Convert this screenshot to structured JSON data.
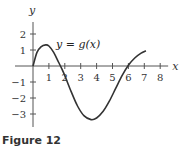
{
  "figure": {
    "caption": "Figure 12"
  },
  "chart_data": {
    "type": "line",
    "title": "",
    "xlabel": "x",
    "ylabel": "y",
    "curve_label": "y = g(x)",
    "xlim": [
      0,
      8.5
    ],
    "ylim": [
      -3.5,
      2.5
    ],
    "x_ticks": [
      1,
      2,
      3,
      4,
      5,
      6,
      7,
      8
    ],
    "y_ticks": [
      -3,
      -2,
      -1,
      1,
      2
    ],
    "grid": false,
    "series": [
      {
        "name": "g(x)",
        "x": [
          0,
          0.25,
          0.5,
          0.8,
          1.0,
          1.3,
          1.6,
          1.8,
          2.0,
          2.4,
          2.8,
          3.2,
          3.65,
          4.0,
          4.4,
          4.8,
          5.2,
          5.6,
          6.0,
          6.4,
          6.8,
          7.1
        ],
        "y": [
          0,
          0.85,
          1.2,
          1.32,
          1.25,
          0.85,
          0.25,
          -0.15,
          -0.6,
          -1.6,
          -2.5,
          -3.1,
          -3.35,
          -3.25,
          -2.85,
          -2.2,
          -1.4,
          -0.6,
          0.05,
          0.5,
          0.8,
          0.95
        ]
      }
    ]
  }
}
